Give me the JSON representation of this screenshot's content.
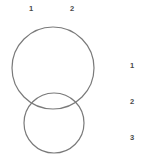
{
  "figure": {
    "type": "two-overlapping-circles-diagram",
    "background_color": "#ffffff",
    "width": 149,
    "height": 163
  },
  "style": {
    "stroke_color": "#7a7a7a",
    "stroke_width": 1.2,
    "fill": "none",
    "label_color": "#4a4a4a"
  },
  "column_labels": [
    {
      "text": "1",
      "x": 31,
      "y": 5
    },
    {
      "text": "2",
      "x": 72,
      "y": 5
    }
  ],
  "row_labels": [
    {
      "text": "1",
      "x": 130,
      "y": 66
    },
    {
      "text": "2",
      "x": 130,
      "y": 102
    },
    {
      "text": "3",
      "x": 130,
      "y": 138
    }
  ],
  "shapes": [
    {
      "name": "upper-circle",
      "shape": "circle",
      "cx": 53,
      "cy": 68,
      "r": 41,
      "stroke": "#7a7a7a",
      "fill": "none"
    },
    {
      "name": "lower-circle",
      "shape": "circle",
      "cx": 54,
      "cy": 123,
      "r": 30,
      "stroke": "#7a7a7a",
      "fill": "none"
    }
  ]
}
